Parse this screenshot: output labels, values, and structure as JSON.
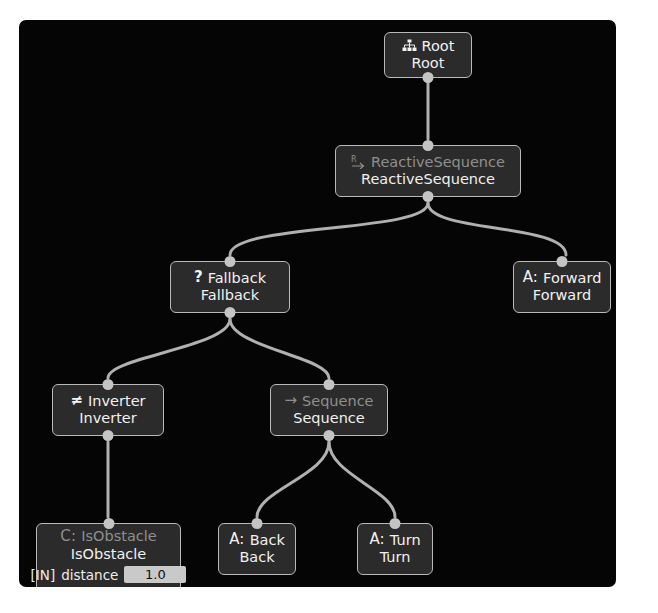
{
  "canvas": {
    "background_color": "#050505",
    "page_background_color": "#ffffff",
    "node_fill_color": "#2b2b2b",
    "node_border_color": "#b9b9b9",
    "edge_color": "#b0b0b0",
    "port_color": "#c4c4c4",
    "dim_text_color": "#8f8f8f",
    "bright_text_color": "#f0f0f0"
  },
  "tree": {
    "nodes": [
      {
        "id": "root",
        "type_label": "Root",
        "instance_name": "Root",
        "icon": "hierarchy-icon",
        "icon_glyph": "",
        "prefix": "",
        "header_bright": true,
        "category": "root"
      },
      {
        "id": "reactive_sequence",
        "type_label": "ReactiveSequence",
        "instance_name": "ReactiveSequence",
        "icon": "reactive-arrow-icon",
        "icon_glyph": "",
        "prefix": "",
        "header_bright": false,
        "category": "control"
      },
      {
        "id": "fallback",
        "type_label": "Fallback",
        "instance_name": "Fallback",
        "icon": "question-mark-icon",
        "icon_glyph": "?",
        "prefix": "",
        "header_bright": true,
        "category": "control"
      },
      {
        "id": "forward",
        "type_label": "Forward",
        "instance_name": "Forward",
        "icon": "action-icon",
        "icon_glyph": "",
        "prefix": "A:",
        "header_bright": true,
        "category": "action"
      },
      {
        "id": "inverter",
        "type_label": "Inverter",
        "instance_name": "Inverter",
        "icon": "not-equal-icon",
        "icon_glyph": "≠",
        "prefix": "",
        "header_bright": true,
        "category": "decorator"
      },
      {
        "id": "sequence",
        "type_label": "Sequence",
        "instance_name": "Sequence",
        "icon": "arrow-right-icon",
        "icon_glyph": "→",
        "prefix": "",
        "header_bright": false,
        "category": "control"
      },
      {
        "id": "is_obstacle",
        "type_label": "IsObstacle",
        "instance_name": "IsObstacle",
        "icon": "condition-icon",
        "icon_glyph": "",
        "prefix": "C:",
        "header_bright": false,
        "category": "condition",
        "ports": [
          {
            "direction_label": "[IN]",
            "name": "distance",
            "value": "1.0"
          }
        ]
      },
      {
        "id": "back",
        "type_label": "Back",
        "instance_name": "Back",
        "icon": "action-icon",
        "icon_glyph": "",
        "prefix": "A:",
        "header_bright": true,
        "category": "action"
      },
      {
        "id": "turn",
        "type_label": "Turn",
        "instance_name": "Turn",
        "icon": "action-icon",
        "icon_glyph": "",
        "prefix": "A:",
        "header_bright": true,
        "category": "action"
      }
    ],
    "edges": [
      {
        "from": "root",
        "to": "reactive_sequence"
      },
      {
        "from": "reactive_sequence",
        "to": "fallback"
      },
      {
        "from": "reactive_sequence",
        "to": "forward"
      },
      {
        "from": "fallback",
        "to": "inverter"
      },
      {
        "from": "fallback",
        "to": "sequence"
      },
      {
        "from": "inverter",
        "to": "is_obstacle"
      },
      {
        "from": "sequence",
        "to": "back"
      },
      {
        "from": "sequence",
        "to": "turn"
      }
    ]
  }
}
